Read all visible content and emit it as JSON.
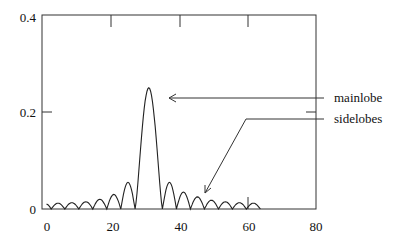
{
  "chart_data": {
    "type": "line",
    "title": "",
    "xlabel": "",
    "ylabel": "",
    "xlim": [
      0,
      80
    ],
    "ylim": [
      0,
      0.4
    ],
    "x_ticks": [
      "0",
      "20",
      "40",
      "60",
      "80"
    ],
    "y_ticks": [
      "0",
      "0.2",
      "0.4"
    ],
    "grid": false,
    "legend": null,
    "series": [
      {
        "name": "array response magnitude",
        "description": "Mainlobe centered near x=31 with peak ~0.25; symmetric sidelobes decaying away from the mainlobe, curve spans roughly x=1 to x=64",
        "mainlobe": {
          "center": 31,
          "peak": 0.25,
          "null_left": 27,
          "null_right": 35
        },
        "sidelobes_left": [
          {
            "from": 1,
            "to": 2.4,
            "peak": 0.01
          },
          {
            "from": 2.4,
            "to": 6.4,
            "peak": 0.012
          },
          {
            "from": 6.4,
            "to": 10.5,
            "peak": 0.013
          },
          {
            "from": 10.5,
            "to": 14.6,
            "peak": 0.015
          },
          {
            "from": 14.6,
            "to": 18.7,
            "peak": 0.02
          },
          {
            "from": 18.7,
            "to": 22.8,
            "peak": 0.03
          },
          {
            "from": 22.8,
            "to": 27,
            "peak": 0.055
          }
        ],
        "sidelobes_right": [
          {
            "from": 35,
            "to": 39.1,
            "peak": 0.055
          },
          {
            "from": 39.1,
            "to": 43.2,
            "peak": 0.035
          },
          {
            "from": 43.2,
            "to": 47.3,
            "peak": 0.025
          },
          {
            "from": 47.3,
            "to": 51.4,
            "peak": 0.018
          },
          {
            "from": 51.4,
            "to": 55.5,
            "peak": 0.015
          },
          {
            "from": 55.5,
            "to": 59.6,
            "peak": 0.013
          },
          {
            "from": 59.6,
            "to": 63.7,
            "peak": 0.012
          }
        ]
      }
    ],
    "annotations": [
      {
        "text": "mainlobe",
        "arrow_to": [
          37,
          0.23
        ]
      },
      {
        "text": "sidelobes",
        "arrow_to": [
          47,
          0.01
        ]
      }
    ]
  },
  "labels": {
    "mainlobe": "mainlobe",
    "sidelobes": "sidelobes",
    "y0": "0",
    "y02": "0.2",
    "y04": "0.4",
    "x0": "0",
    "x20": "20",
    "x40": "40",
    "x60": "60",
    "x80": "80"
  }
}
